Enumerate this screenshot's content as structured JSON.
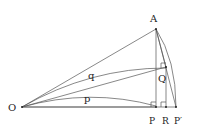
{
  "diagram": {
    "points": {
      "O": "O",
      "A": "A",
      "P": "P",
      "R": "R",
      "Pprime": "P′",
      "Q": "Q"
    },
    "arc_labels": {
      "q": "q",
      "p": "p"
    }
  }
}
